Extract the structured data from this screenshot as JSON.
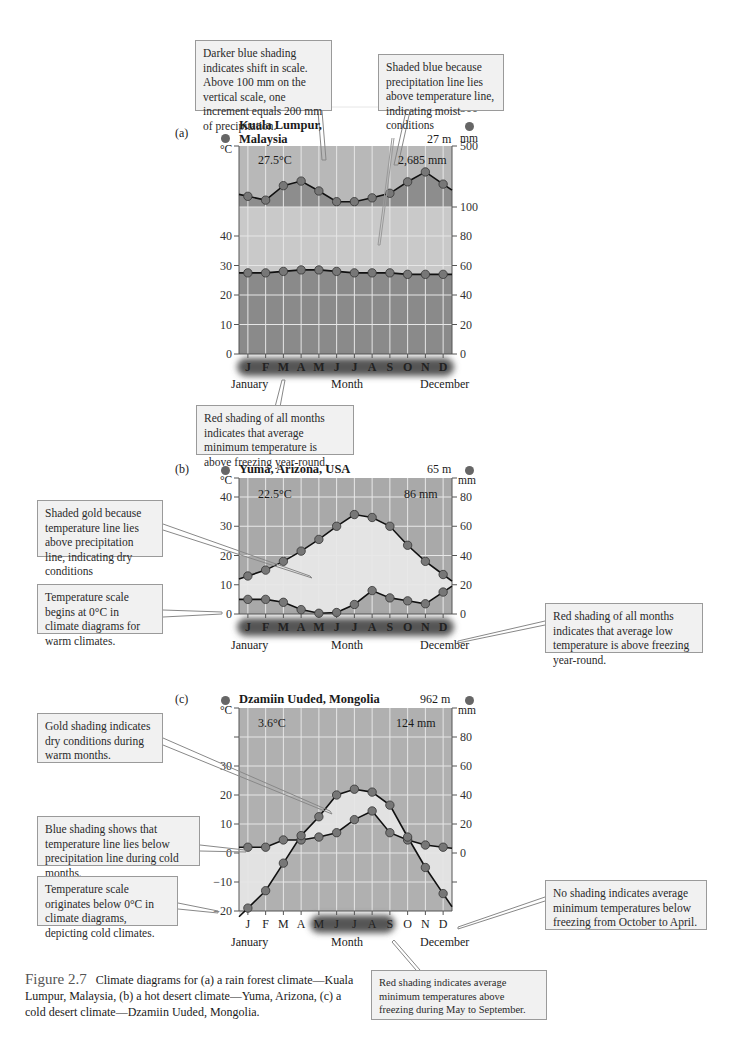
{
  "figure": {
    "number": "Figure 2.7",
    "caption": "Climate diagrams for (a) a rain forest climate—Kuala Lumpur, Malaysia, (b) a hot desert climate—Yuma, Arizona, (c) a cold desert climate—Dzamiin Uuded, Mongolia."
  },
  "panels": [
    {
      "letter": "(a)",
      "title_line1": "Kuala Lumpur,",
      "title_line2": "Malaysia",
      "elevation": "27 m",
      "mean_temp": "27.5°C",
      "annual_precip": "2,685 mm",
      "left_unit": "°C",
      "right_unit": "mm",
      "xlabel_left": "January",
      "xlabel_mid": "Month",
      "xlabel_right": "December"
    },
    {
      "letter": "(b)",
      "title_line1": "Yuma, Arizona, USA",
      "elevation": "65 m",
      "mean_temp": "22.5°C",
      "annual_precip": "86 mm",
      "left_unit": "°C",
      "right_unit": "mm",
      "xlabel_left": "January",
      "xlabel_mid": "Month",
      "xlabel_right": "December"
    },
    {
      "letter": "(c)",
      "title_line1": "Dzamiin Uuded, Mongolia",
      "elevation": "962 m",
      "mean_temp": "3.6°C",
      "annual_precip": "124 mm",
      "left_unit": "°C",
      "right_unit": "mm",
      "xlabel_left": "January",
      "xlabel_mid": "Month",
      "xlabel_right": "December"
    }
  ],
  "callouts": {
    "a_scale": "Darker blue shading indicates shift in scale. Above 100 mm on the vertical scale, one increment equals 200 mm of precipitation.",
    "a_blue": "Shaded blue because precipitation line lies above temperature line, indicating moist conditions",
    "a_red": "Red shading of all months indicates that average minimum temperature is above freezing year-round.",
    "b_gold": "Shaded gold because temperature line lies above precipitation line, indicating dry conditions",
    "b_scale": "Temperature scale begins at 0°C in climate diagrams for warm climates.",
    "b_red": "Red shading of all months indicates that average low temperature is above freezing year-round.",
    "c_gold": "Gold shading indicates dry conditions during warm months.",
    "c_blue": "Blue shading shows that temperature line lies below precipitation line during cold months.",
    "c_scale": "Temperature scale originates below 0°C in climate diagrams, depicting cold climates.",
    "c_none": "No shading indicates average minimum temperatures below freezing from October to April.",
    "c_red": "Red shading indicates average minimum temperatures above freezing during May to September."
  },
  "chart_data": [
    {
      "type": "line",
      "title": "Kuala Lumpur, Malaysia",
      "categories": [
        "J",
        "F",
        "M",
        "A",
        "M",
        "J",
        "J",
        "A",
        "S",
        "O",
        "N",
        "D"
      ],
      "series": [
        {
          "name": "Temperature (°C)",
          "values": [
            27.5,
            27.5,
            28,
            28.5,
            28.5,
            28,
            27.5,
            27.5,
            27.5,
            27,
            27,
            27
          ]
        },
        {
          "name": "Precipitation (mm)",
          "values": [
            170,
            145,
            240,
            270,
            205,
            135,
            135,
            160,
            190,
            265,
            330,
            250
          ]
        }
      ],
      "left_axis": {
        "label": "°C",
        "ticks": [
          0,
          10,
          20,
          30,
          40
        ]
      },
      "right_axis": {
        "label": "mm",
        "ticks": [
          0,
          20,
          40,
          60,
          80,
          100,
          300,
          500
        ]
      },
      "annotations": [
        "27.5°C",
        "2,685 mm",
        "27 m"
      ],
      "xlabel": "Month"
    },
    {
      "type": "line",
      "title": "Yuma, Arizona, USA",
      "categories": [
        "J",
        "F",
        "M",
        "A",
        "M",
        "J",
        "J",
        "A",
        "S",
        "O",
        "N",
        "D"
      ],
      "series": [
        {
          "name": "Temperature (°C)",
          "values": [
            13,
            15,
            18,
            21.5,
            25.5,
            30,
            34,
            33,
            30,
            23.5,
            18,
            13.5
          ]
        },
        {
          "name": "Precipitation (mm)",
          "values": [
            10,
            10,
            8,
            3,
            0.5,
            1,
            6.5,
            16,
            11,
            9,
            7,
            15
          ]
        }
      ],
      "left_axis": {
        "label": "°C",
        "ticks": [
          0,
          10,
          20,
          30,
          40
        ]
      },
      "right_axis": {
        "label": "mm",
        "ticks": [
          0,
          20,
          40,
          60,
          80
        ]
      },
      "annotations": [
        "22.5°C",
        "86 mm",
        "65 m"
      ],
      "xlabel": "Month"
    },
    {
      "type": "line",
      "title": "Dzamiin Uuded, Mongolia",
      "categories": [
        "J",
        "F",
        "M",
        "A",
        "M",
        "J",
        "J",
        "A",
        "S",
        "O",
        "N",
        "D"
      ],
      "series": [
        {
          "name": "Temperature (°C)",
          "values": [
            -19,
            -13,
            -3.5,
            6,
            12.5,
            20,
            22,
            21,
            16.5,
            5.5,
            -5,
            -14
          ]
        },
        {
          "name": "Precipitation (mm)",
          "values": [
            4,
            4,
            9,
            9,
            11,
            14,
            23,
            29,
            14,
            9,
            5.5,
            4
          ]
        }
      ],
      "left_axis": {
        "label": "°C",
        "ticks": [
          -20,
          -10,
          0,
          10,
          20,
          30
        ]
      },
      "right_axis": {
        "label": "mm",
        "ticks": [
          0,
          20,
          40,
          60,
          80
        ]
      },
      "annotations": [
        "3.6°C",
        "124 mm",
        "962 m"
      ],
      "xlabel": "Month"
    }
  ]
}
